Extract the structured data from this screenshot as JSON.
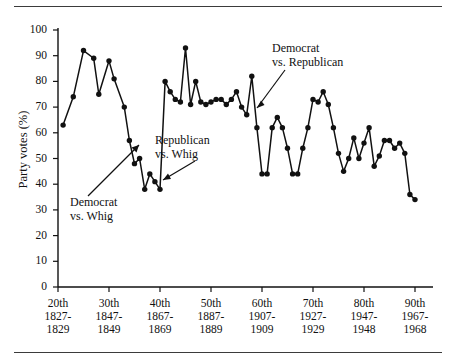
{
  "figure": {
    "axis_title_y": "Party votes (%)",
    "y_ticks": [
      "100",
      "90",
      "80",
      "70",
      "60",
      "50",
      "40",
      "30",
      "20",
      "10",
      "0"
    ],
    "x_ticks": [
      {
        "congress": "20th",
        "start": "1827-",
        "end": "1829"
      },
      {
        "congress": "30th",
        "start": "1847-",
        "end": "1849"
      },
      {
        "congress": "40th",
        "start": "1867-",
        "end": "1869"
      },
      {
        "congress": "50th",
        "start": "1887-",
        "end": "1889"
      },
      {
        "congress": "60th",
        "start": "1907-",
        "end": "1909"
      },
      {
        "congress": "70th",
        "start": "1927-",
        "end": "1929"
      },
      {
        "congress": "80th",
        "start": "1947-",
        "end": "1948"
      },
      {
        "congress": "90th",
        "start": "1967-",
        "end": "1968"
      }
    ],
    "annotations": [
      {
        "id": "dem-whig",
        "line1": "Democrat",
        "line2": "vs. Whig"
      },
      {
        "id": "rep-whig",
        "line1": "Republican",
        "line2": "vs. Whig"
      },
      {
        "id": "dem-rep",
        "line1": "Democrat",
        "line2": "vs. Republican"
      }
    ],
    "colors": {
      "ink": "#111111",
      "rule": "#3b3b3b",
      "background": "#ffffff"
    }
  },
  "chart_data": {
    "type": "line",
    "title": "",
    "xlabel": "",
    "ylabel": "Party votes (%)",
    "ylim": [
      0,
      100
    ],
    "xlim": [
      20,
      90
    ],
    "grid": false,
    "legend": false,
    "marker": "filled-circle",
    "x_tick_values": [
      20,
      30,
      40,
      50,
      60,
      70,
      80,
      90
    ],
    "x_tick_labels": [
      "20th 1827-1829",
      "30th 1847-1849",
      "40th 1867-1869",
      "50th 1887-1889",
      "60th 1907-1909",
      "70th 1927-1929",
      "80th 1947-1948",
      "90th 1967-1968"
    ],
    "y_tick_values": [
      0,
      10,
      20,
      30,
      40,
      50,
      60,
      70,
      80,
      90,
      100
    ],
    "series": [
      {
        "name": "Party votes (%)",
        "x": [
          21,
          23,
          25,
          27,
          28,
          30,
          31,
          33,
          34,
          35,
          36,
          37,
          38,
          39,
          40,
          41,
          42,
          43,
          44,
          45,
          46,
          47,
          48,
          49,
          50,
          51,
          52,
          53,
          54,
          55,
          56,
          57,
          58,
          59,
          60,
          61,
          62,
          63,
          64,
          65,
          66,
          67,
          68,
          69,
          70,
          71,
          72,
          73,
          74,
          75,
          76,
          77,
          78,
          79,
          80,
          81,
          82,
          83,
          84,
          85,
          86,
          87,
          88,
          89,
          90
        ],
        "values": [
          63,
          74,
          92,
          89,
          75,
          88,
          81,
          70,
          57,
          48,
          50,
          38,
          44,
          41,
          38,
          80,
          76,
          73,
          72,
          93,
          71,
          80,
          72,
          71,
          72,
          73,
          73,
          71,
          73,
          76,
          70,
          67,
          82,
          62,
          44,
          44,
          62,
          66,
          62,
          54,
          44,
          44,
          54,
          62,
          73,
          72,
          76,
          71,
          62,
          52,
          45,
          50,
          58,
          50,
          56,
          62,
          47,
          51,
          57,
          57,
          54,
          56,
          52,
          36,
          34
        ]
      }
    ]
  }
}
